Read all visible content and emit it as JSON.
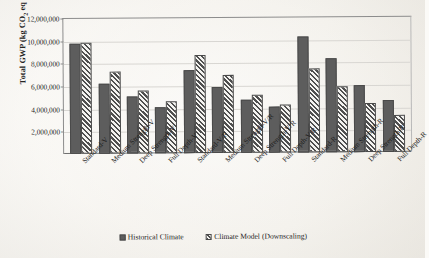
{
  "chart_data": {
    "type": "bar",
    "title": "",
    "xlabel": "",
    "ylabel": "Total GWP (kg CO2 eq / year)",
    "ylabel_parts": {
      "pre": "Total GWP (kg CO",
      "sub": "2",
      "post": " eq / year)"
    },
    "ylim": [
      0,
      12000000
    ],
    "ytick_step": 2000000,
    "yticks": [
      {
        "value": 2000000,
        "label": "2,000,000"
      },
      {
        "value": 4000000,
        "label": "4,000,000"
      },
      {
        "value": 6000000,
        "label": "6,000,000"
      },
      {
        "value": 8000000,
        "label": "8,000,000"
      },
      {
        "value": 10000000,
        "label": "10,000,000"
      },
      {
        "value": 12000000,
        "label": "12,000,000"
      }
    ],
    "grid": true,
    "grid_axis": "y",
    "legend_position": "bottom",
    "categories": [
      "Standard-V",
      "Medium Strength-V",
      "Deep Strength-V",
      "Full Depth-V",
      "Standard-V/R",
      "Medium Strength-V/R",
      "Deep Strength-V/R",
      "Full Depth-V/R",
      "Standard-R",
      "Medium Strength-R",
      "Deep Strength-R",
      "Full Depth-R"
    ],
    "series": [
      {
        "name": "Historical Climate",
        "pattern": "solid",
        "color": "#5d5d5d",
        "values": [
          9800000,
          6250000,
          5100000,
          4050000,
          7400000,
          5900000,
          4700000,
          4100000,
          10300000,
          8400000,
          5950000,
          4650000
        ]
      },
      {
        "name": "Climate Model (Downscaling)",
        "pattern": "diagonal-hatch",
        "color": "#4f4f4f",
        "values": [
          9850000,
          7250000,
          5600000,
          4600000,
          8700000,
          6900000,
          5200000,
          4250000,
          7500000,
          5850000,
          4400000,
          3300000
        ]
      }
    ]
  },
  "legend": {
    "items": [
      {
        "label": "Historical Climate",
        "style": "hist"
      },
      {
        "label": "Climate Model (Downscaling)",
        "style": "model"
      }
    ]
  }
}
